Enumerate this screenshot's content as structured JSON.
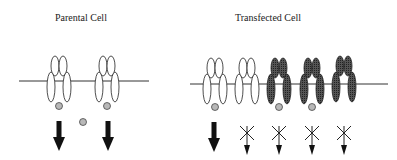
{
  "panels": {
    "parental": {
      "title": "Parental Cell",
      "receptors": [
        {
          "type": "wild-type",
          "ligand_bound": true,
          "signal": "active"
        },
        {
          "type": "wild-type",
          "ligand_bound": true,
          "signal": "active"
        }
      ],
      "free_ligand": true
    },
    "transfected": {
      "title": "Transfected Cell",
      "receptors": [
        {
          "type": "wild-type",
          "ligand_bound": true,
          "signal": "active"
        },
        {
          "type": "wild-type",
          "ligand_bound": false,
          "signal": "blocked"
        },
        {
          "type": "mutant",
          "ligand_bound": true,
          "signal": "blocked"
        },
        {
          "type": "mutant",
          "ligand_bound": true,
          "signal": "blocked"
        },
        {
          "type": "mutant",
          "ligand_bound": false,
          "signal": "blocked"
        }
      ]
    }
  },
  "colors": {
    "wild_type_fill": "#ffffff",
    "mutant_fill": "#3a3a3a",
    "ligand_fill": "#b8b8b8",
    "line": "#222222"
  }
}
